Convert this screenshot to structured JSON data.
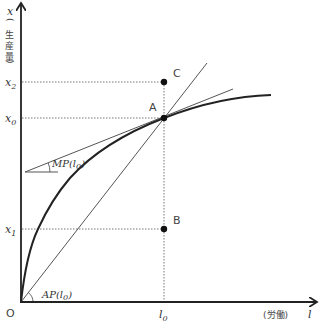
{
  "diagram": {
    "colors": {
      "axis": "#222222",
      "curve": "#222222",
      "thin_line": "#555555",
      "guide": "#666666",
      "point": "#111111",
      "background": "#ffffff"
    },
    "axes": {
      "y": {
        "var": "x",
        "label_chars": [
          "(",
          "生",
          "産",
          "量",
          ")"
        ]
      },
      "x": {
        "label_prefix": "(労働)",
        "var": "l"
      },
      "origin_label": "O"
    },
    "y_ticks": [
      {
        "id": "x2",
        "base": "x",
        "sub": "2"
      },
      {
        "id": "x0",
        "base": "x",
        "sub": "0"
      },
      {
        "id": "x1",
        "base": "x",
        "sub": "1"
      }
    ],
    "x_ticks": [
      {
        "id": "l0",
        "base": "l",
        "sub": "0"
      }
    ],
    "points": [
      {
        "id": "A",
        "label": "A"
      },
      {
        "id": "B",
        "label": "B"
      },
      {
        "id": "C",
        "label": "C"
      }
    ],
    "annotations": {
      "mp": {
        "text": "MP(l",
        "sub": "0",
        "close": ")"
      },
      "ap": {
        "text": "AP(l",
        "sub": "0",
        "close": ")"
      }
    }
  }
}
